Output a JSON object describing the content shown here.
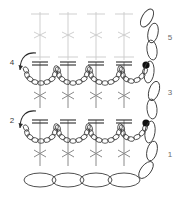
{
  "diagram": {
    "type": "crochet-pattern-chart",
    "width": 184,
    "height": 197,
    "background": "#ffffff",
    "ink_dark": "#3a3a3a",
    "ink_mid": "#7a7a7a",
    "ink_light": "#c9c9c9",
    "accent_dark": "#111111"
  },
  "row_labels": [
    {
      "text": "5",
      "x": 170,
      "y": 40
    },
    {
      "text": "3",
      "x": 170,
      "y": 95
    },
    {
      "text": "1",
      "x": 170,
      "y": 157
    }
  ],
  "direction_markers": [
    {
      "text": "4",
      "x": 12,
      "y": 65
    },
    {
      "text": "2",
      "x": 12,
      "y": 123
    }
  ],
  "legend_symbols": [
    {
      "name": "chain-stitch",
      "glyph": "ellipse"
    },
    {
      "name": "slip-stitch",
      "glyph": "filled-dot"
    },
    {
      "name": "treble-crochet",
      "glyph": "vertical-line-two-bars"
    },
    {
      "name": "direction-arrow",
      "glyph": "curved-arrow"
    }
  ],
  "foundation_chain": {
    "name": "foundation-chain",
    "count": 4,
    "y": 180,
    "x_start": 28,
    "spacing": 28
  },
  "stitch_columns": {
    "count": 4,
    "x_positions": [
      40,
      68,
      96,
      124
    ]
  },
  "rows": [
    {
      "number": 1,
      "kind": "chain-row",
      "y": 180
    },
    {
      "number": 2,
      "kind": "treble-and-chain-arc",
      "y": 130
    },
    {
      "number": 3,
      "kind": "chain-turn",
      "y": 95
    },
    {
      "number": 4,
      "kind": "treble-and-chain-arc",
      "y": 72
    },
    {
      "number": 5,
      "kind": "chain-turn",
      "y": 40
    }
  ],
  "side_chain": {
    "name": "right-turning-chain",
    "segments": 8
  }
}
